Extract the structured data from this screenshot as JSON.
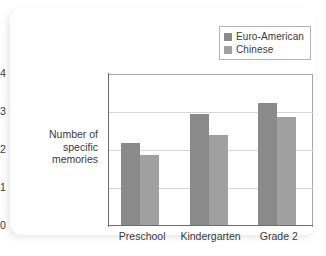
{
  "chart_data": {
    "type": "bar",
    "title": "",
    "xlabel": "",
    "ylabel": "Number of specific memories",
    "ylabel_lines": [
      "Number of",
      "specific",
      "memories"
    ],
    "categories": [
      "Preschool",
      "Kindergarten",
      "Grade 2"
    ],
    "series": [
      {
        "name": "Euro-American",
        "color": "#8a8a8a",
        "values": [
          2.15,
          2.93,
          3.2
        ]
      },
      {
        "name": "Chinese",
        "color": "#a0a0a0",
        "values": [
          1.84,
          2.37,
          2.85
        ]
      }
    ],
    "ylim": [
      0,
      4
    ],
    "yticks": [
      0,
      1,
      2,
      3,
      4
    ],
    "ytick_labels": [
      "0",
      "1",
      "2",
      "3",
      "4"
    ],
    "gridlines": [
      1,
      2,
      3
    ],
    "grid": true,
    "legend_position": "top-right",
    "legend_entries": [
      "Euro-American",
      "Chinese"
    ]
  }
}
